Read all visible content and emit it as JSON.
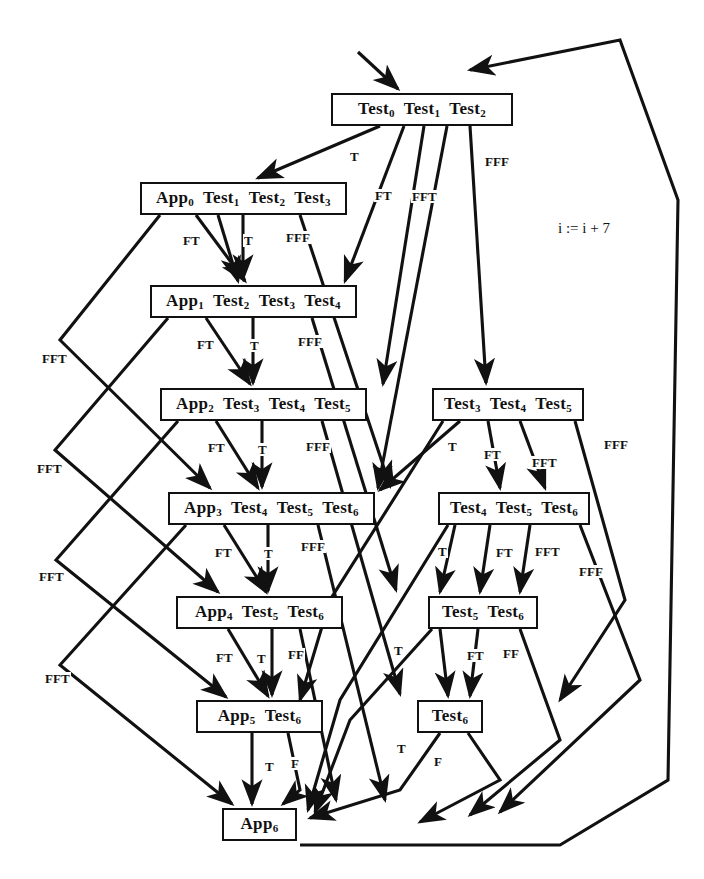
{
  "diagram": {
    "annotation": "i := i + 7",
    "nodes": [
      {
        "id": "n0",
        "label": "Test0 Test1 Test2",
        "tokens": [
          {
            "t": "Test",
            "s": "0"
          },
          {
            "t": "Test",
            "s": "1"
          },
          {
            "t": "Test",
            "s": "2"
          }
        ],
        "x": 331,
        "y": 93,
        "w": 182,
        "h": 33
      },
      {
        "id": "n1",
        "label": "App0 Test1 Test2 Test3",
        "tokens": [
          {
            "t": "App",
            "s": "0"
          },
          {
            "t": "Test",
            "s": "1"
          },
          {
            "t": "Test",
            "s": "2"
          },
          {
            "t": "Test",
            "s": "3"
          }
        ],
        "x": 140,
        "y": 182,
        "w": 207,
        "h": 33
      },
      {
        "id": "n2",
        "label": "App1 Test2 Test3 Test4",
        "tokens": [
          {
            "t": "App",
            "s": "1"
          },
          {
            "t": "Test",
            "s": "2"
          },
          {
            "t": "Test",
            "s": "3"
          },
          {
            "t": "Test",
            "s": "4"
          }
        ],
        "x": 150,
        "y": 285,
        "w": 207,
        "h": 33
      },
      {
        "id": "n3",
        "label": "App2 Test3 Test4 Test5",
        "tokens": [
          {
            "t": "App",
            "s": "2"
          },
          {
            "t": "Test",
            "s": "3"
          },
          {
            "t": "Test",
            "s": "4"
          },
          {
            "t": "Test",
            "s": "5"
          }
        ],
        "x": 160,
        "y": 388,
        "w": 207,
        "h": 33
      },
      {
        "id": "n4",
        "label": "App3 Test4 Test5 Test6",
        "tokens": [
          {
            "t": "App",
            "s": "3"
          },
          {
            "t": "Test",
            "s": "4"
          },
          {
            "t": "Test",
            "s": "5"
          },
          {
            "t": "Test",
            "s": "6"
          }
        ],
        "x": 168,
        "y": 492,
        "w": 207,
        "h": 33
      },
      {
        "id": "n5",
        "label": "App4 Test5 Test6",
        "tokens": [
          {
            "t": "App",
            "s": "4"
          },
          {
            "t": "Test",
            "s": "5"
          },
          {
            "t": "Test",
            "s": "6"
          }
        ],
        "x": 176,
        "y": 596,
        "w": 167,
        "h": 33
      },
      {
        "id": "n6",
        "label": "App5 Test6",
        "tokens": [
          {
            "t": "App",
            "s": "5"
          },
          {
            "t": "Test",
            "s": "6"
          }
        ],
        "x": 196,
        "y": 700,
        "w": 127,
        "h": 33
      },
      {
        "id": "n7",
        "label": "App6",
        "tokens": [
          {
            "t": "App",
            "s": "6"
          }
        ],
        "x": 222,
        "y": 808,
        "w": 75,
        "h": 33
      },
      {
        "id": "r3",
        "label": "Test3 Test4 Test5",
        "tokens": [
          {
            "t": "Test",
            "s": "3"
          },
          {
            "t": "Test",
            "s": "4"
          },
          {
            "t": "Test",
            "s": "5"
          }
        ],
        "x": 432,
        "y": 388,
        "w": 152,
        "h": 33
      },
      {
        "id": "r4",
        "label": "Test4 Test5 Test6",
        "tokens": [
          {
            "t": "Test",
            "s": "4"
          },
          {
            "t": "Test",
            "s": "5"
          },
          {
            "t": "Test",
            "s": "6"
          }
        ],
        "x": 438,
        "y": 492,
        "w": 152,
        "h": 33
      },
      {
        "id": "r5",
        "label": "Test5 Test6",
        "tokens": [
          {
            "t": "Test",
            "s": "5"
          },
          {
            "t": "Test",
            "s": "6"
          }
        ],
        "x": 428,
        "y": 596,
        "w": 110,
        "h": 33
      },
      {
        "id": "r6",
        "label": "Test6",
        "tokens": [
          {
            "t": "Test",
            "s": "6"
          }
        ],
        "x": 417,
        "y": 700,
        "w": 66,
        "h": 33
      }
    ],
    "edge_labels": [
      {
        "text": "T",
        "x": 349,
        "y": 150
      },
      {
        "text": "FT",
        "x": 374,
        "y": 189
      },
      {
        "text": "FFT",
        "x": 411,
        "y": 190
      },
      {
        "text": "FFF",
        "x": 484,
        "y": 155
      },
      {
        "text": "FT",
        "x": 182,
        "y": 234
      },
      {
        "text": "T",
        "x": 243,
        "y": 234
      },
      {
        "text": "FFF",
        "x": 285,
        "y": 231
      },
      {
        "text": "FT",
        "x": 196,
        "y": 338
      },
      {
        "text": "T",
        "x": 249,
        "y": 339
      },
      {
        "text": "FFF",
        "x": 297,
        "y": 335
      },
      {
        "text": "FT",
        "x": 207,
        "y": 441
      },
      {
        "text": "T",
        "x": 257,
        "y": 443
      },
      {
        "text": "FFF",
        "x": 305,
        "y": 440
      },
      {
        "text": "FT",
        "x": 214,
        "y": 546
      },
      {
        "text": "T",
        "x": 263,
        "y": 547
      },
      {
        "text": "FFF",
        "x": 300,
        "y": 540
      },
      {
        "text": "FT",
        "x": 215,
        "y": 651
      },
      {
        "text": "T",
        "x": 256,
        "y": 652
      },
      {
        "text": "FF",
        "x": 287,
        "y": 648
      },
      {
        "text": "T",
        "x": 264,
        "y": 760
      },
      {
        "text": "F",
        "x": 290,
        "y": 757
      },
      {
        "text": "FFT",
        "x": 41,
        "y": 352
      },
      {
        "text": "FFT",
        "x": 36,
        "y": 462
      },
      {
        "text": "FFT",
        "x": 38,
        "y": 570
      },
      {
        "text": "FFT",
        "x": 44,
        "y": 672
      },
      {
        "text": "T",
        "x": 447,
        "y": 440
      },
      {
        "text": "FT",
        "x": 483,
        "y": 448
      },
      {
        "text": "FFT",
        "x": 531,
        "y": 456
      },
      {
        "text": "FFF",
        "x": 603,
        "y": 438
      },
      {
        "text": "T",
        "x": 437,
        "y": 545
      },
      {
        "text": "FT",
        "x": 495,
        "y": 546
      },
      {
        "text": "FFT",
        "x": 534,
        "y": 545
      },
      {
        "text": "FFF",
        "x": 578,
        "y": 565
      },
      {
        "text": "T",
        "x": 393,
        "y": 644
      },
      {
        "text": "FT",
        "x": 466,
        "y": 649
      },
      {
        "text": "FF",
        "x": 502,
        "y": 647
      },
      {
        "text": "T",
        "x": 396,
        "y": 742
      },
      {
        "text": "F",
        "x": 433,
        "y": 755
      }
    ]
  }
}
